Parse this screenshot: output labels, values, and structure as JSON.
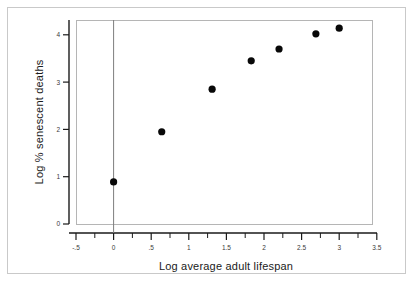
{
  "figure": {
    "background_color": "#ffffff",
    "frame_color": "#c9c9c9",
    "plot_box_color": "#b5b5b5",
    "marker_color": "#080808",
    "reference_line_color": "#7d7d7d"
  },
  "chart_data": {
    "type": "scatter",
    "title": "",
    "xlabel": "Log average adult lifespan",
    "ylabel": "Log % senescent deaths",
    "xlim": [
      -0.65,
      3.5
    ],
    "ylim": [
      0,
      4.55
    ],
    "grid": false,
    "legend": null,
    "x_tick_labels": [
      "-.5",
      "0",
      ".5",
      "1",
      "1.5",
      "2",
      "2.5",
      "3",
      "3.5"
    ],
    "x_tick_values": [
      -0.5,
      0,
      0.5,
      1,
      1.5,
      2,
      2.5,
      3,
      3.5
    ],
    "x_minor_tick_values": [
      -0.25,
      0.25,
      0.75,
      1.25,
      1.75,
      2.25,
      2.75,
      3.25
    ],
    "y_tick_labels": [
      "0",
      "1",
      "2",
      "3",
      "4"
    ],
    "y_tick_values": [
      0,
      1,
      2,
      3,
      4
    ],
    "reference_lines": [
      {
        "orientation": "vertical",
        "value": 0
      }
    ],
    "marker_radius_px": 3.6,
    "points": [
      {
        "x": 0.0,
        "y": 0.89
      },
      {
        "x": 0.64,
        "y": 1.95
      },
      {
        "x": 1.31,
        "y": 2.85
      },
      {
        "x": 1.83,
        "y": 3.45
      },
      {
        "x": 2.2,
        "y": 3.7
      },
      {
        "x": 2.69,
        "y": 4.02
      },
      {
        "x": 3.0,
        "y": 4.14
      }
    ],
    "x": [
      0.0,
      0.64,
      1.31,
      1.83,
      2.2,
      2.69,
      3.0
    ],
    "values": [
      0.89,
      1.95,
      2.85,
      3.45,
      3.7,
      4.02,
      4.14
    ]
  }
}
